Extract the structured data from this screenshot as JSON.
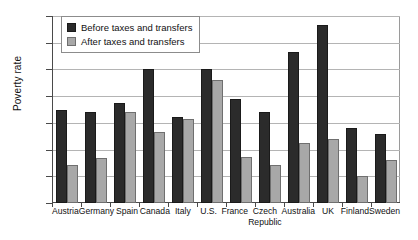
{
  "chart_data": {
    "type": "bar",
    "title": "",
    "subtitle": "",
    "xlabel": "",
    "ylabel": "Poverty rate",
    "ylim": [
      0,
      35
    ],
    "ytick_labels": [
      "35%",
      "30%",
      "25%",
      "20%",
      "15%",
      "10%",
      "5%",
      "0%"
    ],
    "ytick_values": [
      35,
      30,
      25,
      20,
      15,
      10,
      5,
      0
    ],
    "grid": true,
    "legend_position": "top-left-inside",
    "units": "percent",
    "categories": [
      "Austria",
      "Germany",
      "Spain",
      "Canada",
      "Italy",
      "U.S.",
      "France",
      "Czech\nRepublic",
      "Australia",
      "UK",
      "Finland",
      "Sweden"
    ],
    "series": [
      {
        "name": "Before taxes and transfers",
        "color": "#2b2b2b",
        "values": [
          17.5,
          17.0,
          18.8,
          25.0,
          16.1,
          25.0,
          19.4,
          17.0,
          28.2,
          33.3,
          14.1,
          13.0
        ]
      },
      {
        "name": "After taxes and transfers",
        "color": "#a8a8a8",
        "values": [
          7.2,
          8.5,
          17.0,
          13.2,
          15.8,
          23.0,
          8.7,
          7.1,
          11.2,
          12.0,
          5.1,
          8.0
        ]
      }
    ]
  }
}
